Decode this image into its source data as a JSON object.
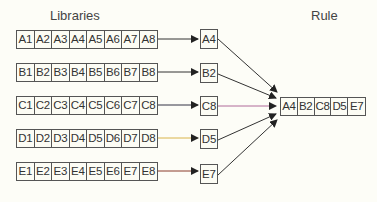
{
  "titles": {
    "libraries": "Libraries",
    "rule": "Rule"
  },
  "libraries": [
    {
      "name": "A",
      "cells": [
        "A1",
        "A2",
        "A3",
        "A4",
        "A5",
        "A6",
        "A7",
        "A8"
      ],
      "selected": "A4",
      "line_color": "#333333"
    },
    {
      "name": "B",
      "cells": [
        "B1",
        "B2",
        "B3",
        "B4",
        "B5",
        "B6",
        "B7",
        "B8"
      ],
      "selected": "B2",
      "line_color": "#333333"
    },
    {
      "name": "C",
      "cells": [
        "C1",
        "C2",
        "C3",
        "C4",
        "C5",
        "C6",
        "C7",
        "C8"
      ],
      "selected": "C8",
      "line_color": "#333366"
    },
    {
      "name": "D",
      "cells": [
        "D1",
        "D2",
        "D3",
        "D4",
        "D5",
        "D6",
        "D7",
        "D8"
      ],
      "selected": "D5",
      "line_color": "#d9b44a"
    },
    {
      "name": "E",
      "cells": [
        "E1",
        "E2",
        "E3",
        "E4",
        "E5",
        "E6",
        "E7",
        "E8"
      ],
      "selected": "E7",
      "line_color": "#8a3a2a"
    }
  ],
  "rule": {
    "cells": [
      "A4",
      "B2",
      "C8",
      "D5",
      "E7"
    ]
  }
}
